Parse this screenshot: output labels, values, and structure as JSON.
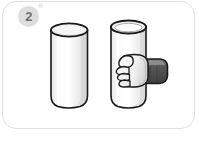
{
  "card": {
    "step_number": "2",
    "border_color": "#e0e0e0",
    "background_color": "#ffffff"
  },
  "badge": {
    "label": "2",
    "fill_color": "#dedede",
    "text_color": "#6e6e6e"
  },
  "bubbles": [
    {
      "name": "bubble-large",
      "color": "#ececec"
    },
    {
      "name": "bubble-small",
      "color": "#f1f1f1"
    }
  ],
  "illustration": {
    "description": "Two vertical cylinders; the right one is being gripped by a hand",
    "objects": [
      {
        "name": "left-cylinder",
        "label": "cylinder",
        "body_color": "#f4f4f4",
        "highlight_color": "#ffffff",
        "shade_color": "#dcdcdc",
        "top_face_color": "#eeeeee",
        "outline_color": "#1a1a1a"
      },
      {
        "name": "right-cylinder",
        "label": "cylinder held in hand",
        "body_color": "#f7f7f7",
        "highlight_color": "#ffffff",
        "shade_color": "#e2e2e2",
        "top_face_color": "#f0f0f0",
        "outline_color": "#1a1a1a"
      },
      {
        "name": "hand",
        "label": "hand gripping cylinder",
        "skin_color": "#f2f2f2",
        "shade_color": "#cfcfcf",
        "outline_color": "#1a1a1a"
      },
      {
        "name": "sleeve",
        "label": "dark sleeve cuff",
        "fill_color": "#4e4e4e",
        "highlight_color": "#8c8c8c",
        "outline_color": "#1a1a1a"
      }
    ]
  }
}
